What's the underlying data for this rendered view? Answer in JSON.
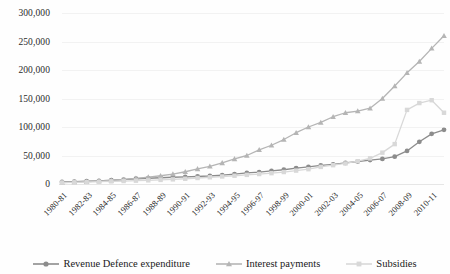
{
  "chart_data": {
    "type": "line",
    "title": "",
    "xlabel": "",
    "ylabel": "",
    "ylim": [
      0,
      300000
    ],
    "ytick_step": 50000,
    "ytick_labels": [
      "300,000",
      "250,000",
      "200,000",
      "150,000",
      "100,000",
      "50,000",
      "0"
    ],
    "ytick_values": [
      300000,
      250000,
      200000,
      150000,
      100000,
      50000,
      0
    ],
    "grid": true,
    "legend_position": "bottom",
    "x": [
      "1980-81",
      "1981-82",
      "1982-83",
      "1983-84",
      "1984-85",
      "1985-86",
      "1986-87",
      "1987-88",
      "1988-89",
      "1989-90",
      "1990-91",
      "1991-92",
      "1992-93",
      "1993-94",
      "1994-95",
      "1995-96",
      "1996-97",
      "1997-98",
      "1998-99",
      "1999-00",
      "2000-01",
      "2001-02",
      "2002-03",
      "2003-04",
      "2004-05",
      "2005-06",
      "2006-07",
      "2007-08",
      "2008-09",
      "2009-10",
      "2010-11",
      "2011-12"
    ],
    "xtick_labels": [
      "1980-81",
      "1982-83",
      "1984-85",
      "1986-87",
      "1988-89",
      "1990-91",
      "1992-93",
      "1994-95",
      "1996-97",
      "1998-99",
      "2000-01",
      "2002-03",
      "2004-05",
      "2006-07",
      "2008-09",
      "2010-11"
    ],
    "series": [
      {
        "name": "Revenue Defence expenditure",
        "color": "#8c8c8c",
        "marker": "circle",
        "values": [
          3600,
          4200,
          4900,
          5600,
          6600,
          7600,
          9200,
          10100,
          11000,
          11800,
          12500,
          13200,
          14000,
          15600,
          17500,
          19500,
          21000,
          23000,
          25000,
          28000,
          30000,
          32500,
          34500,
          37000,
          39500,
          42000,
          44000,
          48000,
          58000,
          74000,
          88000,
          95000
        ]
      },
      {
        "name": "Interest payments",
        "color": "#b5b5b5",
        "marker": "triangle",
        "values": [
          2600,
          3300,
          4100,
          5100,
          6400,
          8000,
          9900,
          12000,
          14500,
          17500,
          21500,
          26500,
          31000,
          37000,
          44000,
          50000,
          60000,
          68000,
          78000,
          90000,
          100000,
          108000,
          118000,
          125000,
          128000,
          133000,
          150000,
          172000,
          195000,
          215000,
          238000,
          260000
        ]
      },
      {
        "name": "Subsidies",
        "color": "#d8d8d8",
        "marker": "square",
        "values": [
          2500,
          3000,
          3400,
          4000,
          4600,
          5200,
          5800,
          6400,
          7200,
          8100,
          9200,
          10500,
          11800,
          13200,
          14500,
          16000,
          17500,
          19000,
          21000,
          23500,
          26000,
          30000,
          33000,
          36000,
          40000,
          45000,
          55000,
          70000,
          130000,
          142000,
          147000,
          125000
        ]
      }
    ]
  },
  "legend": {
    "items": [
      {
        "label": "Revenue Defence expenditure",
        "color": "#8c8c8c",
        "marker": "circle"
      },
      {
        "label": "Interest payments",
        "color": "#b5b5b5",
        "marker": "triangle"
      },
      {
        "label": "Subsidies",
        "color": "#d8d8d8",
        "marker": "square"
      }
    ]
  }
}
